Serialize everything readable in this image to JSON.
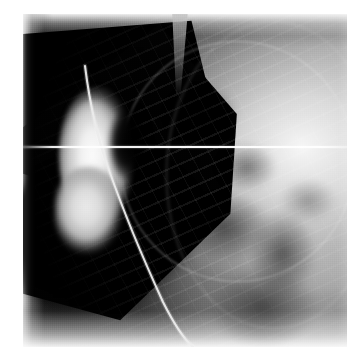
{
  "viewer": {
    "name": "radiograph-viewer",
    "background_color": "#ffffff",
    "alt_text": "Lateral radiographic / fluoroscopic image of the chest showing a contrast-filled cardiac chamber and an indwelling catheter"
  },
  "plate": {
    "name": "radiograph-image",
    "x": 23,
    "y": 14,
    "width": 324,
    "height": 333,
    "modality": "X-ray angiography",
    "border_color": "#ffffff",
    "base_color": "#0a0a0a"
  },
  "features": {
    "dark_wedge_label": "dark mediastinal wedge",
    "bright_chamber_label": "contrast-filled chamber",
    "catheter_label": "catheter",
    "collimator_arc_label": "collimator field edge",
    "rib_texture_label": "rib and vascular markings",
    "dark_lobe_label": "dark lower-left lobe",
    "scanline_label": "horizontal scan line"
  },
  "scanline": {
    "y": 132,
    "thickness": 2,
    "color": "#ffffff"
  },
  "catheter": {
    "stroke_color": "#e8e8e8",
    "path": "M 62 52 C 66 84, 72 118, 86 156 C 100 196, 118 240, 140 288 C 152 312, 162 326, 170 333",
    "width": 2.1
  },
  "palette": {
    "black": "#000000",
    "near_black": "#0a0a0a",
    "mid_gray": "#6a6a6a",
    "light_gray": "#d2d2d2",
    "white": "#ffffff",
    "contrast_bright": "#fbfbfb"
  }
}
